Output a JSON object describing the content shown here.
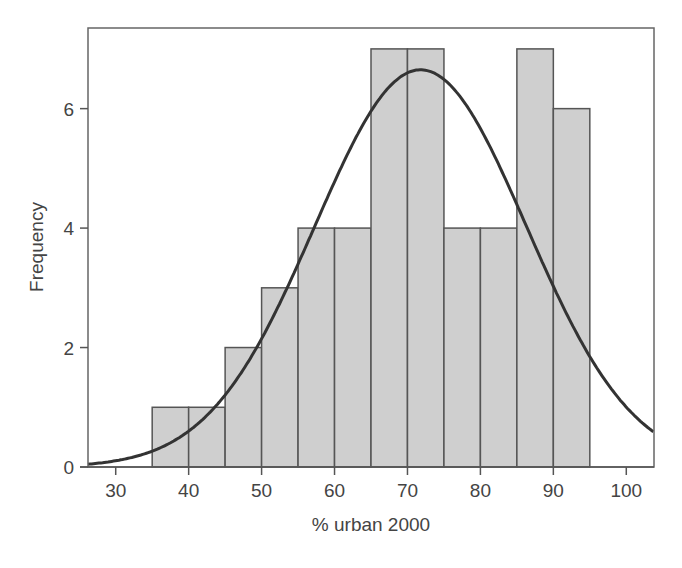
{
  "chart_data": {
    "type": "bar",
    "subtype": "histogram_with_normal_curve",
    "title": "",
    "xlabel": "% urban 2000",
    "ylabel": "Frequency",
    "xlim": [
      26.2,
      103.8
    ],
    "ylim": [
      0,
      7.35
    ],
    "x_ticks": [
      30,
      40,
      50,
      60,
      70,
      80,
      90,
      100
    ],
    "y_ticks": [
      0,
      2,
      4,
      6
    ],
    "bin_width": 5,
    "bins": [
      {
        "from": 35,
        "to": 40,
        "count": 1
      },
      {
        "from": 40,
        "to": 45,
        "count": 1
      },
      {
        "from": 45,
        "to": 50,
        "count": 2
      },
      {
        "from": 50,
        "to": 55,
        "count": 3
      },
      {
        "from": 55,
        "to": 60,
        "count": 4
      },
      {
        "from": 60,
        "to": 65,
        "count": 4
      },
      {
        "from": 65,
        "to": 70,
        "count": 7
      },
      {
        "from": 70,
        "to": 75,
        "count": 7
      },
      {
        "from": 75,
        "to": 80,
        "count": 4
      },
      {
        "from": 80,
        "to": 85,
        "count": 4
      },
      {
        "from": 85,
        "to": 90,
        "count": 7
      },
      {
        "from": 90,
        "to": 95,
        "count": 6
      }
    ],
    "normal_curve": {
      "mean": 71.8,
      "sd": 14.5,
      "peak": 6.65
    },
    "grid": false,
    "legend": null,
    "colors": {
      "bar_fill": "#cfcfcf",
      "bar_edge": "#555555",
      "curve": "#333333",
      "frame": "#666666"
    }
  }
}
